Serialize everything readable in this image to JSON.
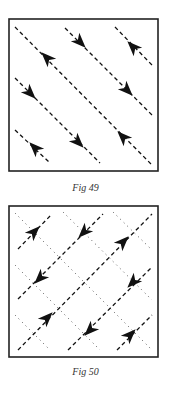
{
  "figures": [
    {
      "id": "fig49",
      "caption": "Fig 49",
      "box": {
        "x": 9,
        "y": 19,
        "w": 149,
        "h": 152
      },
      "dashed_lines": [
        {
          "x1": 15,
          "y1": 27,
          "x2": 152,
          "y2": 165
        },
        {
          "x1": 65,
          "y1": 28,
          "x2": 152,
          "y2": 115
        },
        {
          "x1": 115,
          "y1": 27,
          "x2": 152,
          "y2": 65
        },
        {
          "x1": 15,
          "y1": 78,
          "x2": 100,
          "y2": 163
        },
        {
          "x1": 15,
          "y1": 130,
          "x2": 50,
          "y2": 163
        }
      ],
      "dotted_lines": [],
      "arrows": [
        {
          "x": 47,
          "y": 58,
          "direction": "up-left"
        },
        {
          "x": 123,
          "y": 137,
          "direction": "up-left"
        },
        {
          "x": 80,
          "y": 42,
          "direction": "down-right"
        },
        {
          "x": 127,
          "y": 90,
          "direction": "down-right"
        },
        {
          "x": 133,
          "y": 47,
          "direction": "up-left"
        },
        {
          "x": 30,
          "y": 93,
          "direction": "down-right"
        },
        {
          "x": 78,
          "y": 142,
          "direction": "down-right"
        },
        {
          "x": 35,
          "y": 148,
          "direction": "up-left"
        }
      ]
    },
    {
      "id": "fig50",
      "caption": "Fig 50",
      "box": {
        "x": 9,
        "y": 206,
        "w": 149,
        "h": 151
      },
      "dashed_lines": [
        {
          "x1": 18,
          "y1": 249,
          "x2": 52,
          "y2": 214
        },
        {
          "x1": 18,
          "y1": 299,
          "x2": 103,
          "y2": 214
        },
        {
          "x1": 18,
          "y1": 350,
          "x2": 152,
          "y2": 214
        },
        {
          "x1": 68,
          "y1": 350,
          "x2": 152,
          "y2": 267
        },
        {
          "x1": 117,
          "y1": 350,
          "x2": 152,
          "y2": 315
        }
      ],
      "dotted_lines": [
        {
          "x1": 15,
          "y1": 213,
          "x2": 152,
          "y2": 350
        },
        {
          "x1": 63,
          "y1": 212,
          "x2": 152,
          "y2": 300
        },
        {
          "x1": 113,
          "y1": 212,
          "x2": 152,
          "y2": 250
        },
        {
          "x1": 15,
          "y1": 265,
          "x2": 100,
          "y2": 350
        },
        {
          "x1": 15,
          "y1": 315,
          "x2": 50,
          "y2": 350
        }
      ],
      "arrows": [
        {
          "x": 34,
          "y": 232,
          "direction": "up-right"
        },
        {
          "x": 84,
          "y": 232,
          "direction": "down-left"
        },
        {
          "x": 123,
          "y": 242,
          "direction": "up-right"
        },
        {
          "x": 40,
          "y": 278,
          "direction": "down-left"
        },
        {
          "x": 133,
          "y": 282,
          "direction": "down-left"
        },
        {
          "x": 47,
          "y": 318,
          "direction": "up-right"
        },
        {
          "x": 90,
          "y": 330,
          "direction": "down-left"
        },
        {
          "x": 130,
          "y": 335,
          "direction": "up-right"
        }
      ]
    }
  ],
  "captions": {
    "fig49": {
      "text": "Fig 49",
      "y": 182
    },
    "fig50": {
      "text": "Fig 50",
      "y": 366
    }
  },
  "colors": {
    "ink": "#111111",
    "frame": "#222222",
    "dots": "#555555",
    "background": "#ffffff"
  }
}
